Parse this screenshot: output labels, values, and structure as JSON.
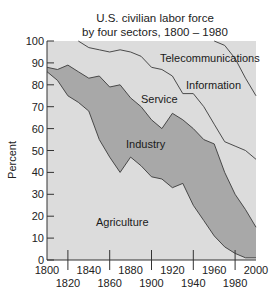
{
  "chart_data": {
    "type": "area",
    "stacked": true,
    "title_lines": [
      "U.S. civilian labor force",
      "by four sectors, 1800 – 1980"
    ],
    "xlabel": "",
    "ylabel": "Percent",
    "xlim": [
      1800,
      2000
    ],
    "ylim": [
      0,
      100
    ],
    "x_ticks_upper": [
      "1800",
      "1840",
      "1880",
      "1920",
      "1960",
      "2000"
    ],
    "x_ticks_lower": [
      "1820",
      "1860",
      "1900",
      "1940",
      "1980"
    ],
    "y_ticks": [
      "0",
      "10",
      "20",
      "30",
      "40",
      "50",
      "60",
      "70",
      "80",
      "90",
      "100"
    ],
    "grid": false,
    "legend": "inline labels",
    "x": [
      1800,
      1810,
      1820,
      1830,
      1840,
      1850,
      1860,
      1870,
      1880,
      1890,
      1900,
      1910,
      1920,
      1930,
      1940,
      1950,
      1960,
      1970,
      1980,
      1990,
      2000
    ],
    "cumulative_boundaries": {
      "agriculture_top": [
        86,
        82,
        75,
        72,
        68,
        55,
        47,
        40,
        47,
        43,
        38,
        37,
        33,
        35,
        25,
        18,
        11,
        6,
        3,
        1,
        1
      ],
      "industry_top": [
        88,
        87,
        89,
        86,
        83,
        84,
        79,
        80,
        74,
        70,
        64,
        60,
        67,
        64,
        60,
        55,
        53,
        40,
        30,
        23,
        15
      ],
      "service_top": [
        100,
        100,
        100,
        100,
        97,
        96,
        95,
        96,
        95,
        93,
        88,
        87,
        84,
        76,
        76,
        70,
        62,
        54,
        52,
        50,
        46
      ],
      "information_top": [
        100,
        100,
        100,
        100,
        100,
        100,
        100,
        100,
        100,
        100,
        100,
        100,
        100,
        100,
        100,
        100,
        100,
        98,
        92,
        83,
        75
      ]
    },
    "series": [
      {
        "name": "Agriculture",
        "values": [
          86,
          82,
          75,
          72,
          68,
          55,
          47,
          40,
          47,
          43,
          38,
          37,
          33,
          35,
          25,
          18,
          11,
          6,
          3,
          1,
          1
        ],
        "color": "#d9d9d9"
      },
      {
        "name": "Industry",
        "values": [
          2,
          5,
          14,
          14,
          15,
          29,
          32,
          40,
          27,
          27,
          26,
          23,
          34,
          29,
          35,
          37,
          42,
          34,
          27,
          22,
          14
        ],
        "color": "#a6a6a6"
      },
      {
        "name": "Service",
        "values": [
          12,
          13,
          11,
          14,
          14,
          12,
          16,
          16,
          21,
          23,
          24,
          27,
          17,
          12,
          16,
          15,
          9,
          14,
          22,
          27,
          31
        ],
        "color": "#d9d9d9"
      },
      {
        "name": "Information",
        "values": [
          0,
          0,
          0,
          0,
          3,
          4,
          5,
          4,
          5,
          7,
          12,
          13,
          16,
          24,
          24,
          30,
          38,
          44,
          40,
          33,
          29
        ],
        "color": "#d9d9d9"
      },
      {
        "name": "Telecommunications",
        "values": [
          0,
          0,
          0,
          0,
          0,
          0,
          0,
          0,
          0,
          0,
          0,
          0,
          0,
          0,
          0,
          0,
          0,
          2,
          8,
          17,
          25
        ],
        "color": "#d9d9d9"
      }
    ],
    "annotations": [
      "Telecommunications",
      "Information",
      "Service",
      "Industry",
      "Agriculture"
    ]
  },
  "colors": {
    "light_area": "#dcdcdc",
    "dark_area": "#a8a8a8",
    "line": "#3a3a3a",
    "axis": "#333333"
  }
}
